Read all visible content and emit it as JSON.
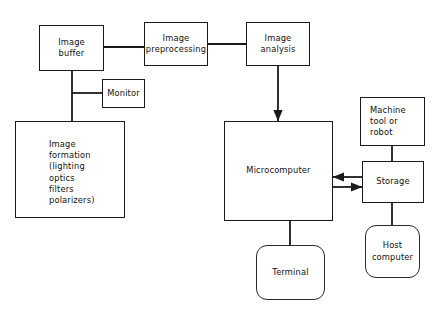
{
  "diagram": {
    "background_color": "#ffffff",
    "line_color": "#1a1a1a",
    "text_color": "#111111",
    "nodes": [
      {
        "id": "image-buffer",
        "label": "Image\nbuffer",
        "shape": "rectangle",
        "x": 39,
        "y": 25,
        "w": 65,
        "h": 46,
        "align": "center"
      },
      {
        "id": "image-preprocessing",
        "label": "Image\npreprocessing",
        "shape": "rectangle",
        "x": 144,
        "y": 22,
        "w": 64,
        "h": 44,
        "align": "center"
      },
      {
        "id": "image-analysis",
        "label": "Image\nanalysis",
        "shape": "rectangle",
        "x": 246,
        "y": 22,
        "w": 64,
        "h": 44,
        "align": "center"
      },
      {
        "id": "monitor",
        "label": "Monitor",
        "shape": "rectangle",
        "x": 102,
        "y": 79,
        "w": 43,
        "h": 29,
        "align": "center"
      },
      {
        "id": "image-formation",
        "label": "Image\nformation\n(lighting\noptics\nfilters\npolarizers)",
        "shape": "rectangle",
        "x": 15,
        "y": 121,
        "w": 110,
        "h": 97,
        "align": "topleft"
      },
      {
        "id": "microcomputer",
        "label": "Microcomputer",
        "shape": "rectangle",
        "x": 224,
        "y": 121,
        "w": 109,
        "h": 100,
        "align": "center"
      },
      {
        "id": "machine-tool-or-robot",
        "label": "Machine\ntool or\nrobot",
        "shape": "rectangle",
        "x": 360,
        "y": 97,
        "w": 65,
        "h": 49,
        "align": "left"
      },
      {
        "id": "storage",
        "label": "Storage",
        "shape": "rectangle",
        "x": 362,
        "y": 161,
        "w": 62,
        "h": 42,
        "align": "center"
      },
      {
        "id": "terminal",
        "label": "Terminal",
        "shape": "rounded-rectangle",
        "x": 256,
        "y": 245,
        "w": 69,
        "h": 55,
        "align": "center"
      },
      {
        "id": "host-computer",
        "label": "Host\ncomputer",
        "shape": "rounded-rectangle",
        "x": 365,
        "y": 225,
        "w": 55,
        "h": 53,
        "align": "center"
      }
    ],
    "connectors": [
      {
        "id": "buffer-to-preprocessing",
        "from": "image-buffer",
        "to": "image-preprocessing",
        "arrow": "none",
        "path": "M 104 47 L 144 47"
      },
      {
        "id": "preprocessing-to-analysis",
        "from": "image-preprocessing",
        "to": "image-analysis",
        "arrow": "none",
        "path": "M 208 44 L 246 44"
      },
      {
        "id": "buffer-trunk-down",
        "from": "image-buffer",
        "to": "image-formation",
        "arrow": "none",
        "path": "M 72 71 L 72 121"
      },
      {
        "id": "trunk-to-monitor",
        "from": "image-buffer",
        "to": "monitor",
        "arrow": "none",
        "path": "M 72 93 L 102 93"
      },
      {
        "id": "analysis-to-microcomputer",
        "from": "image-analysis",
        "to": "microcomputer",
        "arrow": "end",
        "path": "M 278 66 L 278 121"
      },
      {
        "id": "storage-to-microcomputer",
        "from": "storage",
        "to": "microcomputer",
        "arrow": "end",
        "path": "M 362 177 L 333 177"
      },
      {
        "id": "microcomputer-to-storage",
        "from": "microcomputer",
        "to": "storage",
        "arrow": "end",
        "path": "M 333 187 L 362 187"
      },
      {
        "id": "machine-tool-to-storage",
        "from": "machine-tool-or-robot",
        "to": "storage",
        "arrow": "none",
        "path": "M 392 146 L 392 161"
      },
      {
        "id": "microcomputer-to-terminal",
        "from": "microcomputer",
        "to": "terminal",
        "arrow": "none",
        "path": "M 290 221 L 290 245"
      },
      {
        "id": "storage-to-host-computer",
        "from": "storage",
        "to": "host-computer",
        "arrow": "none",
        "path": "M 392 203 L 392 225"
      }
    ]
  }
}
